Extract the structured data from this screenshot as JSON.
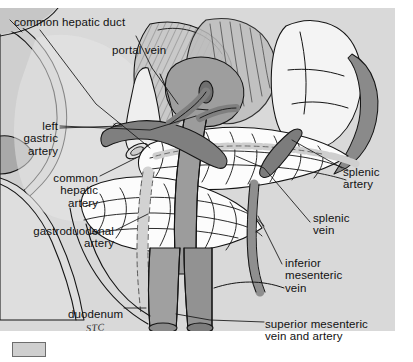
{
  "figure": {
    "signature": "STC",
    "palette": {
      "background": "#d9d9d9",
      "page": "#ffffff",
      "organ_light": "#e4e4e4",
      "organ_mid": "#c2c2c2",
      "organ_dark": "#9a9a9a",
      "vessel_dark": "#8d8d8d",
      "vessel_darker": "#707070",
      "pancreas_fill": "#fbfbfb",
      "ink": "#141414"
    }
  },
  "labels": [
    {
      "id": "common-hepatic-duct",
      "text": "common hepatic duct",
      "align": "left",
      "x": 14,
      "y": 16
    },
    {
      "id": "portal-vein",
      "text": "portal vein",
      "align": "left",
      "x": 112,
      "y": 44
    },
    {
      "id": "left-gastric-artery",
      "text": "left\ngastric\nartery",
      "align": "right",
      "x": 12,
      "y": 120
    },
    {
      "id": "common-hepatic-artery",
      "text": "common\nhepatic\nartery",
      "align": "right",
      "x": 40,
      "y": 172
    },
    {
      "id": "gastroduodenal-artery",
      "text": "gastroduodenal\nartery",
      "align": "right",
      "x": 58,
      "y": 225
    },
    {
      "id": "duodenum",
      "text": "duodenum",
      "align": "left",
      "x": 68,
      "y": 308
    },
    {
      "id": "splenic-artery",
      "text": "splenic\nartery",
      "align": "left",
      "x": 343,
      "y": 166
    },
    {
      "id": "splenic-vein",
      "text": "splenic\nvein",
      "align": "left",
      "x": 313,
      "y": 212
    },
    {
      "id": "inferior-mesenteric-vein",
      "text": "inferior\nmesenteric\nvein",
      "align": "left",
      "x": 285,
      "y": 257
    },
    {
      "id": "superior-mesenteric-vein-artery",
      "text": "superior mesenteric\nvein and artery",
      "align": "left",
      "x": 265,
      "y": 318
    }
  ],
  "structures": [
    {
      "id": "liver",
      "name": "liver (retracted)"
    },
    {
      "id": "stomach",
      "name": "stomach (reflected)"
    },
    {
      "id": "pancreas",
      "name": "pancreas"
    },
    {
      "id": "duodenum-loop",
      "name": "duodenum"
    },
    {
      "id": "spleen",
      "name": "spleen"
    },
    {
      "id": "portal-vein",
      "name": "portal vein"
    },
    {
      "id": "splenic-vessels",
      "name": "splenic artery and vein"
    },
    {
      "id": "hepatic-duct",
      "name": "common hepatic duct"
    },
    {
      "id": "mesenteric-vessels",
      "name": "superior mesenteric vein and artery"
    }
  ]
}
